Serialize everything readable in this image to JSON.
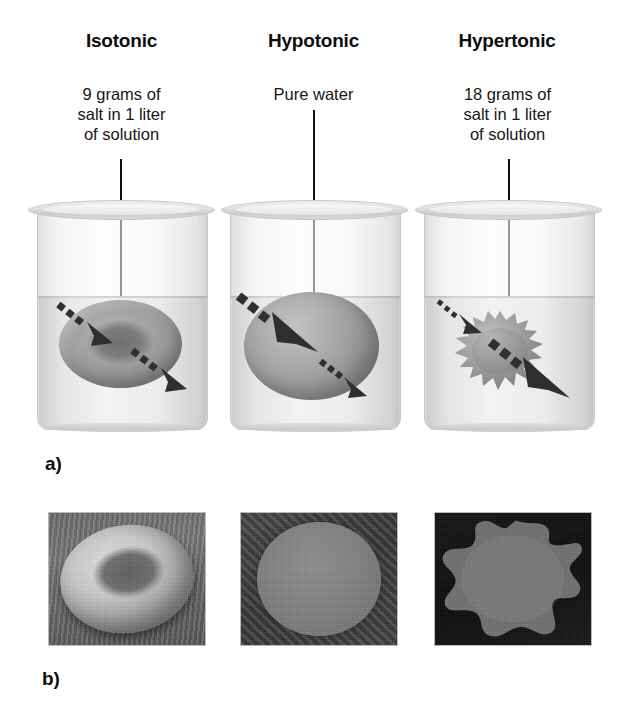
{
  "figure": {
    "panel_a_label": "a)",
    "panel_b_label": "b)"
  },
  "columns": [
    {
      "key": "isotonic",
      "title": "Isotonic",
      "description": "9 grams of\nsalt in 1 liter\nof solution",
      "cell_shape": "biconcave-disc",
      "water_in_arrow": "equal",
      "water_out_arrow": "equal",
      "micrograph_caption": "biconcave red blood cell"
    },
    {
      "key": "hypotonic",
      "title": "Hypotonic",
      "description": "Pure water",
      "cell_shape": "swollen-sphere",
      "water_in_arrow": "large",
      "water_out_arrow": "small",
      "micrograph_caption": "swollen spherical red blood cell"
    },
    {
      "key": "hypertonic",
      "title": "Hypertonic",
      "description": "18 grams of\nsalt in 1 liter\nof solution",
      "cell_shape": "crenated",
      "water_in_arrow": "small",
      "water_out_arrow": "large",
      "micrograph_caption": "crenated shriveled red blood cell"
    }
  ],
  "colors": {
    "text": "#111111",
    "glass": "#e6e8e6",
    "water": "#d0d3d0",
    "cell_fill": "#9b9b9b",
    "arrow": "#2e2e2e"
  }
}
